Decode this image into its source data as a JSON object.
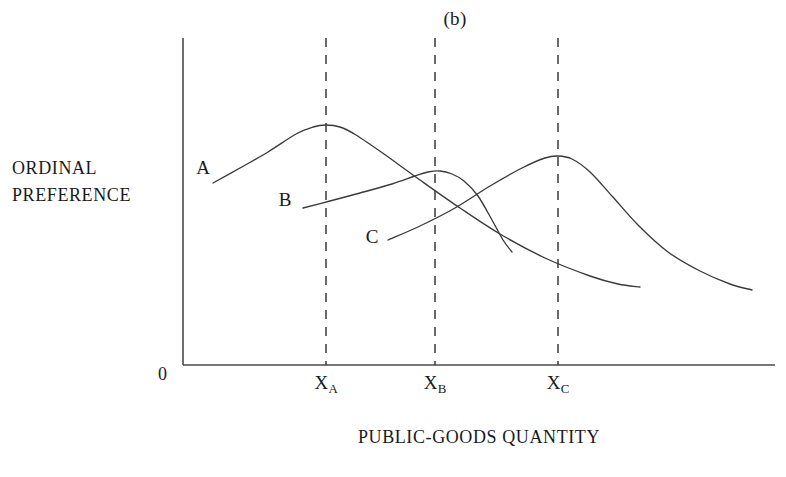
{
  "figure": {
    "panel_label": "(b)",
    "origin_label": "0"
  },
  "axes": {
    "y_label_line1": "ORDINAL",
    "y_label_line2": "PREFERENCE",
    "x_label": "PUBLIC-GOODS QUANTITY"
  },
  "ticks": [
    {
      "base": "X",
      "sub": "A"
    },
    {
      "base": "X",
      "sub": "B"
    },
    {
      "base": "X",
      "sub": "C"
    }
  ],
  "curve_labels": [
    {
      "text": "A"
    },
    {
      "text": "B"
    },
    {
      "text": "C"
    }
  ],
  "colors": {
    "ink": "#1a1a1a",
    "axis": "#4a4a4a",
    "curve": "#3a3a3a",
    "gridline": "#3a3a3a",
    "background": "#ffffff"
  },
  "chart_data": {
    "type": "line",
    "title": "(b)",
    "xlabel": "PUBLIC-GOODS QUANTITY",
    "ylabel": "ORDINAL PREFERENCE",
    "grid": false,
    "legend": "inline-curve-labels",
    "axis_note": "Unnumbered ordinal axes; origin marked 0. Vertical dashed reference lines drop from each curve peak to its x-axis tick.",
    "x_tick_labels": [
      "X_A",
      "X_B",
      "X_C"
    ],
    "x_tick_positions_px": [
      326,
      435,
      558
    ],
    "x_axis_px": {
      "x_start": 183,
      "x_end": 775,
      "y": 365
    },
    "y_axis_px": {
      "x": 183,
      "y_top": 38,
      "y_bottom": 365
    },
    "series": [
      {
        "name": "A",
        "label_px": {
          "x": 203,
          "y": 168
        },
        "peak_at_tick": "X_A",
        "peak_px": {
          "x": 326,
          "y": 125
        },
        "points_px": [
          [
            213,
            183
          ],
          [
            240,
            168
          ],
          [
            268,
            152
          ],
          [
            296,
            134
          ],
          [
            313,
            127
          ],
          [
            326,
            125
          ],
          [
            340,
            127
          ],
          [
            356,
            135
          ],
          [
            384,
            154
          ],
          [
            420,
            180
          ],
          [
            460,
            208
          ],
          [
            500,
            234
          ],
          [
            545,
            258
          ],
          [
            590,
            276
          ],
          [
            618,
            284
          ],
          [
            640,
            287
          ]
        ]
      },
      {
        "name": "B",
        "label_px": {
          "x": 285,
          "y": 200
        },
        "peak_at_tick": "X_B",
        "peak_px": {
          "x": 435,
          "y": 172
        },
        "points_px": [
          [
            303,
            208
          ],
          [
            330,
            201
          ],
          [
            360,
            193
          ],
          [
            392,
            184
          ],
          [
            415,
            176
          ],
          [
            428,
            172
          ],
          [
            440,
            171
          ],
          [
            452,
            174
          ],
          [
            464,
            181
          ],
          [
            478,
            196
          ],
          [
            492,
            220
          ],
          [
            503,
            240
          ],
          [
            512,
            252
          ]
        ]
      },
      {
        "name": "C",
        "label_px": {
          "x": 372,
          "y": 237
        },
        "peak_at_tick": "X_C",
        "peak_px": {
          "x": 558,
          "y": 156
        },
        "points_px": [
          [
            388,
            240
          ],
          [
            420,
            226
          ],
          [
            455,
            208
          ],
          [
            490,
            186
          ],
          [
            522,
            168
          ],
          [
            545,
            158
          ],
          [
            558,
            156
          ],
          [
            572,
            159
          ],
          [
            590,
            172
          ],
          [
            612,
            196
          ],
          [
            638,
            225
          ],
          [
            668,
            252
          ],
          [
            700,
            271
          ],
          [
            730,
            284
          ],
          [
            752,
            290
          ]
        ]
      }
    ]
  }
}
